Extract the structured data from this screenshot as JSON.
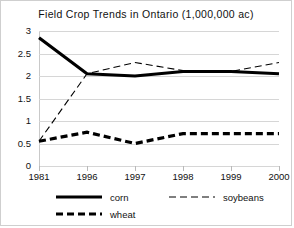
{
  "chart_data": {
    "type": "line",
    "title": "Field Crop Trends in Ontario (1,000,000 ac)",
    "xlabel": "",
    "ylabel": "",
    "categories": [
      "1981",
      "1996",
      "1997",
      "1998",
      "1999",
      "2000"
    ],
    "series": [
      {
        "name": "corn",
        "values": [
          2.85,
          2.05,
          2.0,
          2.1,
          2.1,
          2.05
        ],
        "style": "solid-thick",
        "color": "#000000"
      },
      {
        "name": "soybeans",
        "values": [
          0.55,
          2.05,
          2.3,
          2.12,
          2.1,
          2.3
        ],
        "style": "dashed-thin",
        "color": "#000000"
      },
      {
        "name": "wheat",
        "values": [
          0.55,
          0.75,
          0.5,
          0.72,
          0.72,
          0.72
        ],
        "style": "dashed-thick",
        "color": "#000000"
      }
    ],
    "ylim": [
      0,
      3
    ],
    "yticks": [
      0,
      0.5,
      1,
      1.5,
      2,
      2.5,
      3
    ],
    "ytick_labels": [
      "0",
      "0.5",
      "1",
      "1.5",
      "2",
      "2.5",
      "3"
    ],
    "grid": true,
    "legend_position": "bottom",
    "legend": [
      {
        "label": "corn",
        "style": "solid-thick"
      },
      {
        "label": "soybeans",
        "style": "dashed-thin"
      },
      {
        "label": "wheat",
        "style": "dashed-thick"
      }
    ],
    "colors": {
      "axis": "#c9c9c9",
      "grid": "#d6d6d6",
      "text": "#111111",
      "border": "#cfcfcf"
    }
  }
}
